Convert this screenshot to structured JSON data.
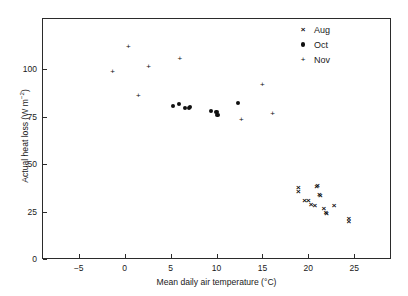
{
  "chart_data": {
    "type": "scatter",
    "title": "",
    "xlabel": "Mean daily air temperature (°C)",
    "ylabel": "Actual heat loss (W m⁻²)",
    "ylabel_main": "Actual heat loss (W m",
    "ylabel_exp": "−2",
    "ylabel_tail": ")",
    "xlabel_main": "Mean daily air temperature (°C)",
    "xlim": [
      -9,
      29
    ],
    "ylim": [
      0,
      127
    ],
    "grid": false,
    "legend_position": "top-right",
    "xticks": [
      -5,
      0,
      5,
      10,
      15,
      20,
      25
    ],
    "xticklabels": [
      "−5",
      "0",
      "5",
      "10",
      "15",
      "20",
      "25"
    ],
    "yticks": [
      0,
      25,
      50,
      75,
      100
    ],
    "yticklabels": [
      "0",
      "25",
      "50",
      "75",
      "100"
    ],
    "series": [
      {
        "name": "Aug",
        "marker": "x",
        "points": [
          [
            18.9,
            37.5
          ],
          [
            18.9,
            35.5
          ],
          [
            19.6,
            30.5
          ],
          [
            20.0,
            30.5
          ],
          [
            20.3,
            28.5
          ],
          [
            20.7,
            28.0
          ],
          [
            20.9,
            38.0
          ],
          [
            21.0,
            38.5
          ],
          [
            21.2,
            33.5
          ],
          [
            21.3,
            33.0
          ],
          [
            21.7,
            26.5
          ],
          [
            21.9,
            24.0
          ],
          [
            22.0,
            23.5
          ],
          [
            22.8,
            28.0
          ],
          [
            24.4,
            21.0
          ],
          [
            24.4,
            19.5
          ]
        ]
      },
      {
        "name": "Oct",
        "marker": "o",
        "points": [
          [
            5.3,
            80.5
          ],
          [
            5.9,
            81.5
          ],
          [
            6.6,
            79.5
          ],
          [
            7.0,
            79.5
          ],
          [
            7.1,
            80.0
          ],
          [
            9.4,
            78.0
          ],
          [
            10.0,
            77.5
          ],
          [
            10.1,
            76.0
          ],
          [
            12.3,
            82.0
          ]
        ]
      },
      {
        "name": "Nov",
        "marker": "+",
        "points": [
          [
            -1.3,
            98.5
          ],
          [
            0.4,
            111.5
          ],
          [
            1.5,
            86.0
          ],
          [
            2.6,
            101.0
          ],
          [
            6.0,
            105.5
          ],
          [
            12.7,
            73.5
          ],
          [
            15.0,
            91.5
          ],
          [
            16.1,
            76.5
          ]
        ]
      }
    ]
  },
  "legend": {
    "entries": [
      {
        "label": "Aug",
        "glyph": "×"
      },
      {
        "label": "Oct",
        "glyph": "dot"
      },
      {
        "label": "Nov",
        "glyph": "+"
      }
    ]
  },
  "artifact": {
    "corner_text": ""
  }
}
